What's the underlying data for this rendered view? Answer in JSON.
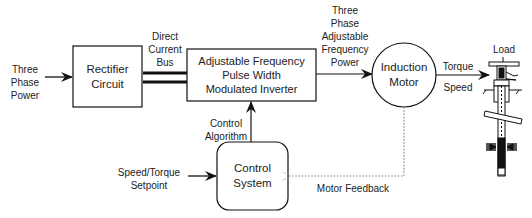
{
  "diagram": {
    "inputs": {
      "three_phase_power": [
        "Three",
        "Phase",
        "Power"
      ],
      "setpoint": [
        "Speed/Torque",
        "Setpoint"
      ]
    },
    "blocks": {
      "rectifier": [
        "Rectifier",
        "Circuit"
      ],
      "inverter": [
        "Adjustable Frequency",
        "Pulse Width",
        "Modulated Inverter"
      ],
      "motor": [
        "Induction",
        "Motor"
      ],
      "control": [
        "Control",
        "System"
      ],
      "load": "Load"
    },
    "connections": {
      "dc_bus": [
        "Direct",
        "Current",
        "Bus"
      ],
      "inverter_output": [
        "Three",
        "Phase",
        "Adjustable",
        "Frequency",
        "Power"
      ],
      "motor_output_top": "Torque",
      "motor_output_bottom": "Speed",
      "control_algorithm": [
        "Control",
        "Algorithm"
      ],
      "feedback": "Motor Feedback"
    },
    "colors": {
      "line": "#111111",
      "feedback_line": "#777777",
      "background": "#ffffff"
    }
  }
}
